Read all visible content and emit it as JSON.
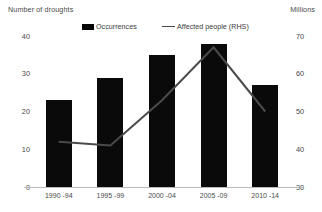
{
  "axis_titles": {
    "left": "Number of droughts",
    "right": "Millions"
  },
  "legend": {
    "bar_label": "Occurrences",
    "line_label": "Affected people (RHS)",
    "bar_icon": "filled-square-icon",
    "line_icon": "line-segment-icon"
  },
  "colors": {
    "bar": "#0a0a0a",
    "line": "#4a4a4a",
    "axis": "#b9b9b9",
    "text": "#4a4a4a",
    "background": "#ffffff"
  },
  "ticks": {
    "left": [
      "40",
      "30",
      "20",
      "10",
      "0"
    ],
    "right": [
      "70",
      "60",
      "50",
      "40",
      "30"
    ]
  },
  "chart_data": {
    "type": "bar",
    "title": "",
    "xlabel": "",
    "ylabel": "Number of droughts",
    "y2label": "Millions",
    "categories": [
      "1990 -94",
      "1995 -99",
      "2000 -04",
      "2005 -09",
      "2010 -14"
    ],
    "ylim": [
      0,
      40
    ],
    "y2lim": [
      30,
      70
    ],
    "yticks": [
      0,
      10,
      20,
      30,
      40
    ],
    "y2ticks": [
      30,
      40,
      50,
      60,
      70
    ],
    "grid": false,
    "legend_position": "top-center",
    "series": [
      {
        "name": "Occurrences",
        "type": "bar",
        "axis": "left",
        "values": [
          23,
          29,
          35,
          38,
          27
        ]
      },
      {
        "name": "Affected people (RHS)",
        "type": "line",
        "axis": "right",
        "values": [
          42,
          41,
          53,
          67,
          50
        ]
      }
    ]
  }
}
